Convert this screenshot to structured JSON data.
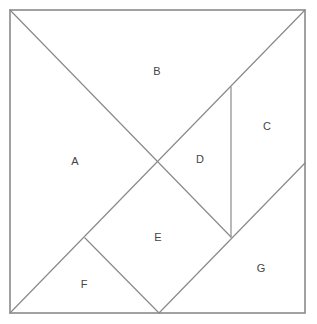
{
  "diagram": {
    "line_color": "#8a8a8a",
    "label_color": "#444444",
    "frame": {
      "x1": 10,
      "y1": 10,
      "x2": 305,
      "y2": 313
    },
    "pieces": [
      {
        "id": "A",
        "label": "A",
        "shape": "large-triangle",
        "points": "10,10 157,161 10,313",
        "label_pos": [
          75,
          162
        ]
      },
      {
        "id": "B",
        "label": "B",
        "shape": "large-triangle",
        "points": "10,10 305,10 157,161",
        "label_pos": [
          157,
          72
        ]
      },
      {
        "id": "C",
        "label": "C",
        "shape": "parallelogram",
        "points": "231,87 305,10 305,163 231,237",
        "label_pos": [
          267,
          127
        ]
      },
      {
        "id": "D",
        "label": "D",
        "shape": "small-triangle",
        "points": "157,161 231,87 231,237",
        "label_pos": [
          200,
          160
        ]
      },
      {
        "id": "E",
        "label": "E",
        "shape": "square",
        "points": "157,161 231,237 159,313 85,238",
        "label_pos": [
          158,
          238
        ]
      },
      {
        "id": "F",
        "label": "F",
        "shape": "small-triangle",
        "points": "85,238 159,313 10,313",
        "label_pos": [
          84,
          285
        ]
      },
      {
        "id": "G",
        "label": "G",
        "shape": "medium-triangle",
        "points": "305,163 305,313 159,313",
        "label_pos": [
          261,
          269
        ]
      }
    ]
  }
}
